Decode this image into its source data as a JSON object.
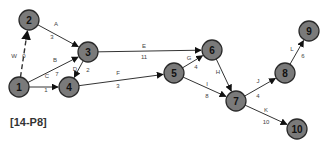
{
  "caption": "[14-P8]",
  "colors": {
    "node_fill": "#7a7a7a",
    "node_stroke": "#2a2a2a",
    "edge": "#333333"
  },
  "nodes": [
    {
      "id": "1",
      "x": 19,
      "y": 87
    },
    {
      "id": "2",
      "x": 29,
      "y": 20
    },
    {
      "id": "3",
      "x": 88,
      "y": 52
    },
    {
      "id": "4",
      "x": 69,
      "y": 87
    },
    {
      "id": "5",
      "x": 174,
      "y": 73
    },
    {
      "id": "6",
      "x": 212,
      "y": 50
    },
    {
      "id": "7",
      "x": 236,
      "y": 101
    },
    {
      "id": "8",
      "x": 285,
      "y": 73
    },
    {
      "id": "9",
      "x": 309,
      "y": 31
    },
    {
      "id": "10",
      "x": 297,
      "y": 129
    }
  ],
  "edges": [
    {
      "from": "1",
      "to": "2",
      "activity": "W",
      "duration": "0",
      "dummy": true,
      "lx": 14,
      "ly": 56,
      "nx": 24,
      "ny": 56
    },
    {
      "from": "2",
      "to": "3",
      "activity": "A",
      "duration": "3",
      "lx": 56,
      "ly": 24,
      "nx": 52,
      "ny": 37
    },
    {
      "from": "1",
      "to": "3",
      "activity": "B",
      "duration": "7",
      "lx": 55,
      "ly": 60,
      "nx": 57,
      "ny": 74
    },
    {
      "from": "1",
      "to": "4",
      "activity": "C",
      "duration": "1",
      "lx": 47,
      "ly": 76,
      "nx": 46,
      "ny": 90
    },
    {
      "from": "3",
      "to": "4",
      "activity": "D",
      "duration": "2",
      "lx": 75,
      "ly": 69,
      "nx": 88,
      "ny": 70
    },
    {
      "from": "3",
      "to": "6",
      "activity": "E",
      "duration": "11",
      "lx": 144,
      "ly": 46,
      "nx": 144,
      "ny": 57
    },
    {
      "from": "4",
      "to": "5",
      "activity": "F",
      "duration": "3",
      "lx": 118,
      "ly": 73,
      "nx": 118,
      "ny": 86
    },
    {
      "from": "5",
      "to": "6",
      "activity": "G",
      "duration": "4",
      "lx": 189,
      "ly": 58,
      "nx": 196,
      "ny": 67
    },
    {
      "from": "6",
      "to": "7",
      "activity": "H",
      "duration": "",
      "lx": 218,
      "ly": 72,
      "nx": 226,
      "ny": 72
    },
    {
      "from": "5",
      "to": "7",
      "activity": "I",
      "duration": "8",
      "lx": 207,
      "ly": 84,
      "nx": 207,
      "ny": 96
    },
    {
      "from": "7",
      "to": "8",
      "activity": "J",
      "duration": "4",
      "lx": 258,
      "ly": 81,
      "nx": 258,
      "ny": 96
    },
    {
      "from": "7",
      "to": "10",
      "activity": "K",
      "duration": "10",
      "lx": 266,
      "ly": 110,
      "nx": 266,
      "ny": 122
    },
    {
      "from": "8",
      "to": "9",
      "activity": "L",
      "duration": "6",
      "lx": 292,
      "ly": 49,
      "nx": 303,
      "ny": 56
    }
  ]
}
